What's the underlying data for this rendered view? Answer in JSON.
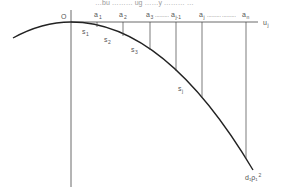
{
  "diagram": {
    "caption_partial": "…bu ……… ug ……y ……… …",
    "origin_label": "O",
    "axis_label": {
      "base": "u",
      "sub": "j"
    },
    "points": [
      {
        "base": "a",
        "sub": "1"
      },
      {
        "base": "a",
        "sub": "2"
      },
      {
        "base": "a",
        "sub": "3"
      },
      {
        "base": "a",
        "sub": "j-1"
      },
      {
        "base": "a",
        "sub": "j"
      },
      {
        "base": "a",
        "sub": "n"
      }
    ],
    "dots": "..........",
    "segments": [
      {
        "base": "s",
        "sub": "1"
      },
      {
        "base": "s",
        "sub": "2"
      },
      {
        "base": "s",
        "sub": "3"
      },
      {
        "base": "s",
        "sub": "j"
      }
    ],
    "end_label": {
      "text": "d₁ρ₁",
      "sup": "2"
    }
  }
}
